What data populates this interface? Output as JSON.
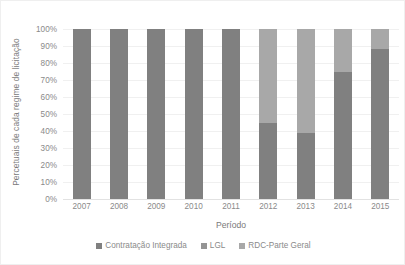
{
  "chart_data": {
    "type": "bar",
    "subtype": "100% stacked column",
    "title": "",
    "xlabel": "Período",
    "ylabel": "Percetuais de cada regime de licitação",
    "ylim": [
      0,
      100
    ],
    "yticks": [
      "0%",
      "10%",
      "20%",
      "30%",
      "40%",
      "50%",
      "60%",
      "70%",
      "80%",
      "90%",
      "100%"
    ],
    "ytick_values": [
      0,
      10,
      20,
      30,
      40,
      50,
      60,
      70,
      80,
      90,
      100
    ],
    "grid": true,
    "legend_position": "bottom",
    "categories": [
      "2007",
      "2008",
      "2009",
      "2010",
      "2011",
      "2012",
      "2013",
      "2014",
      "2015"
    ],
    "series": [
      {
        "name": "Contratação Integrada",
        "color": "#808080",
        "values": [
          100,
          100,
          100,
          100,
          100,
          45,
          39,
          75,
          88
        ]
      },
      {
        "name": "LGL",
        "color": "#949494",
        "values": [
          0,
          0,
          0,
          0,
          0,
          0,
          0,
          0,
          0
        ]
      },
      {
        "name": "RDC-Parte Geral",
        "color": "#a8a8a8",
        "values": [
          0,
          0,
          0,
          0,
          0,
          55,
          61,
          25,
          12
        ]
      }
    ]
  },
  "legend": {
    "items": [
      {
        "label": "Contratação Integrada",
        "color": "#808080"
      },
      {
        "label": "LGL",
        "color": "#949494"
      },
      {
        "label": "RDC-Parte Geral",
        "color": "#a8a8a8"
      }
    ]
  },
  "colors": {
    "background": "#ffffff",
    "gridline": "#f0f0f0",
    "baseline": "#e2e2e2",
    "text": "#8a8a8a",
    "border": "#efefef"
  }
}
